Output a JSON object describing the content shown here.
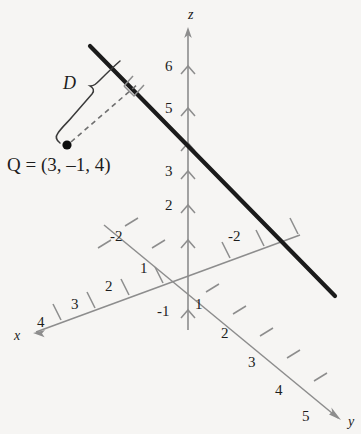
{
  "figure": {
    "kind": "3d-coordinate-axes-diagram",
    "background_color": "#f6f5f3",
    "axis_color": "#8d8d8d",
    "line_color": "#1b1b1b",
    "text_color": "#1d1d1d"
  },
  "axes": {
    "z": {
      "name": "z",
      "name_pos": [
        191,
        10
      ],
      "arrow_tip": [
        188,
        28
      ],
      "origin": [
        188,
        278
      ],
      "ticks": [
        {
          "label": "6",
          "pos": [
            168,
            60
          ],
          "tick_y": 68
        },
        {
          "label": "5",
          "pos": [
            168,
            102
          ],
          "tick_y": 110
        },
        {
          "label": "4",
          "pos": null,
          "tick_y": 145,
          "hidden_behind_line": true
        },
        {
          "label": "3",
          "pos": [
            168,
            165
          ],
          "tick_y": 173
        },
        {
          "label": "2",
          "pos": [
            168,
            199
          ],
          "tick_y": 207
        },
        {
          "label": "1",
          "pos": null,
          "tick_y": 242,
          "hidden": true
        },
        {
          "label": "-1",
          "pos": [
            160,
            305
          ],
          "tick_y": 312
        }
      ]
    },
    "x": {
      "name": "x",
      "name_pos": [
        16,
        330
      ],
      "arrow_tip": [
        33,
        333
      ],
      "ticks": [
        {
          "label": "1",
          "pos": [
            141,
            262
          ]
        },
        {
          "label": "2",
          "pos": [
            106,
            281
          ]
        },
        {
          "label": "3",
          "pos": [
            72,
            299
          ]
        },
        {
          "label": "4",
          "pos": [
            38,
            317
          ]
        }
      ],
      "negative_ticks": [
        {
          "label": "-2",
          "pos": [
            229,
            230
          ]
        }
      ]
    },
    "y": {
      "name": "y",
      "name_pos": [
        347,
        416
      ],
      "arrow_tip": [
        341,
        420
      ],
      "ticks": [
        {
          "label": "1",
          "pos": [
            196,
            298
          ]
        },
        {
          "label": "2",
          "pos": [
            222,
            327
          ]
        },
        {
          "label": "3",
          "pos": [
            249,
            357
          ]
        },
        {
          "label": "4",
          "pos": [
            276,
            385
          ]
        },
        {
          "label": "5",
          "pos": [
            303,
            411
          ]
        }
      ],
      "negative_ticks": [
        {
          "label": "-2",
          "pos": [
            111,
            230
          ]
        }
      ]
    }
  },
  "line": {
    "name": "plane-trace-line",
    "start": [
      90,
      46
    ],
    "end": [
      335,
      296
    ],
    "stroke_width": 4.2
  },
  "point": {
    "marker_pos": [
      67,
      145
    ],
    "label": "Q = (3, –1, 4)",
    "label_pos": [
      7,
      155
    ]
  },
  "distance": {
    "label": "D",
    "label_pos": [
      64,
      76
    ],
    "dashed_from": [
      70,
      143
    ],
    "dashed_to": [
      137,
      83
    ],
    "foot_of_perpendicular": [
      137,
      83
    ],
    "right_angle_marker": true
  }
}
